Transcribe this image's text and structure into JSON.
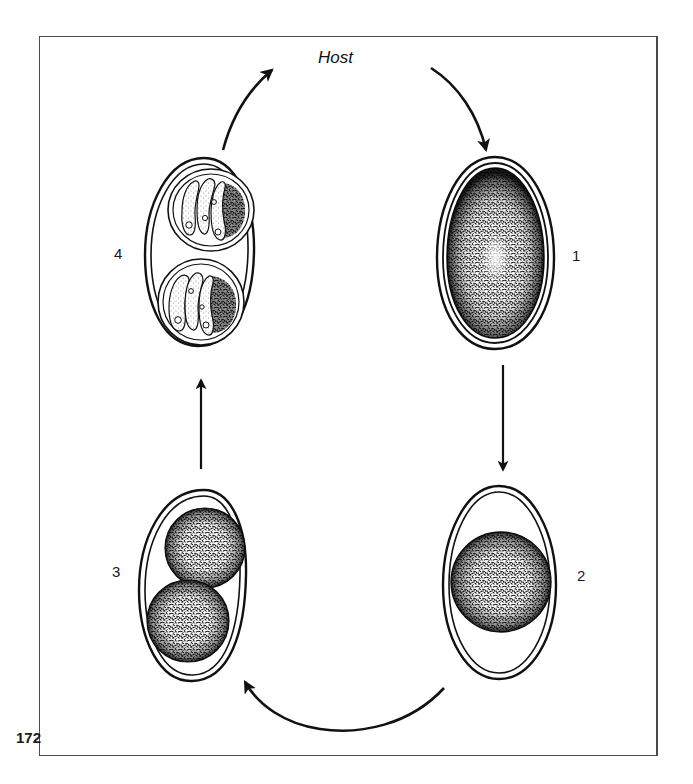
{
  "figure": {
    "page_number": "172",
    "host_label": "Host",
    "stages": [
      {
        "id": 1,
        "label": "1",
        "description": "unsporulated oocyst with granular zygote filling shell"
      },
      {
        "id": 2,
        "label": "2",
        "description": "oocyst with contracted spherical sporont"
      },
      {
        "id": 3,
        "label": "3",
        "description": "sporont dividing into two sporoblasts"
      },
      {
        "id": 4,
        "label": "4",
        "description": "sporulated oocyst with two sporocysts each containing sporozoites and residual body"
      }
    ],
    "arrows": [
      {
        "from": "host",
        "to": "1"
      },
      {
        "from": "1",
        "to": "2"
      },
      {
        "from": "2",
        "to": "3"
      },
      {
        "from": "3",
        "to": "4"
      },
      {
        "from": "4",
        "to": "host"
      }
    ],
    "colors": {
      "ink": "#111111",
      "frame": "#4a4a4a",
      "background": "#ffffff"
    }
  }
}
